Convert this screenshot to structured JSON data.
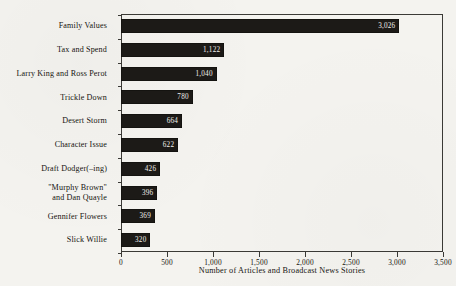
{
  "chart_data": {
    "type": "bar",
    "orientation": "horizontal",
    "title": "",
    "xlabel": "Number of Articles and Broadcast News Stories",
    "ylabel": "",
    "xlim": [
      0,
      3500
    ],
    "xticks": [
      0,
      500,
      1000,
      1500,
      2000,
      2500,
      3000,
      3500
    ],
    "xtick_labels": [
      "0",
      "500",
      "1,000",
      "1,500",
      "2,000",
      "2,500",
      "3,000",
      "3,500"
    ],
    "grid": false,
    "legend": null,
    "bar_color": "#1c1a17",
    "value_label_color": "#f2f1ec",
    "background_color": "#f4f3ef",
    "axis_color": "#3b3a36",
    "categories": [
      "Family Values",
      "Tax and Spend",
      "Larry King and Ross Perot",
      "Trickle Down",
      "Desert Storm",
      "Character Issue",
      "Draft Dodger(–ing)",
      "\"Murphy Brown\"\nand Dan Quayle",
      "Gennifer Flowers",
      "Slick Willie"
    ],
    "values": [
      3026,
      1122,
      1040,
      780,
      664,
      622,
      426,
      396,
      369,
      320
    ],
    "value_labels": [
      "3,026",
      "1,122",
      "1,040",
      "780",
      "664",
      "622",
      "426",
      "396",
      "369",
      "320"
    ]
  }
}
